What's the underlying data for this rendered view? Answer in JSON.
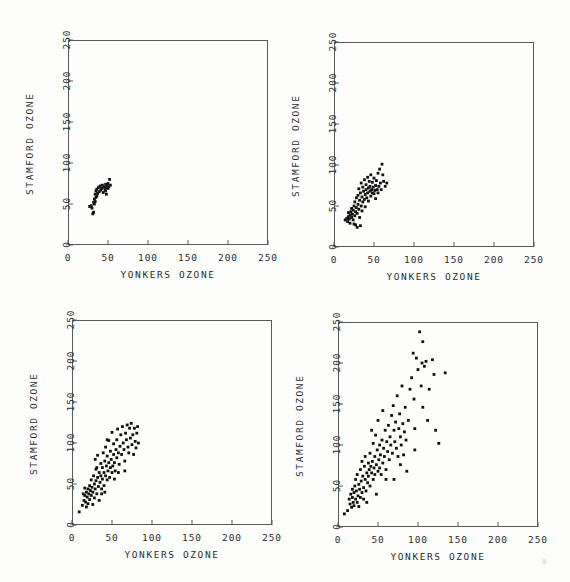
{
  "figure": {
    "background_color": "#fdfdfc",
    "ink_color": "#111111",
    "frame_color": "#5a5a5a",
    "width": 570,
    "height": 582
  },
  "chart_data": [
    {
      "id": "panel-top-left",
      "type": "scatter",
      "title": "",
      "xlabel": "YONKERS OZONE",
      "ylabel": "STAMFORD OZONE",
      "xlim": [
        0,
        250
      ],
      "ylim": [
        0,
        250
      ],
      "xticks": [
        0,
        50,
        100,
        150,
        200,
        250
      ],
      "yticks": [
        0,
        50,
        100,
        150,
        200,
        250
      ],
      "xticklabels": [
        "0",
        "50",
        "100",
        "150",
        "200",
        "250"
      ],
      "yticklabels": [
        "0",
        "50",
        "100",
        "150",
        "200",
        "250"
      ],
      "grid": false,
      "legend": "none",
      "marker": "filled-square",
      "points": [
        [
          27,
          47
        ],
        [
          29,
          48
        ],
        [
          30,
          45
        ],
        [
          31,
          38
        ],
        [
          32,
          40
        ],
        [
          32,
          52
        ],
        [
          33,
          50
        ],
        [
          33,
          56
        ],
        [
          34,
          62
        ],
        [
          34,
          53
        ],
        [
          35,
          58
        ],
        [
          35,
          66
        ],
        [
          36,
          60
        ],
        [
          36,
          68
        ],
        [
          37,
          63
        ],
        [
          38,
          70
        ],
        [
          39,
          65
        ],
        [
          40,
          72
        ],
        [
          41,
          67
        ],
        [
          42,
          69
        ],
        [
          43,
          73
        ],
        [
          44,
          64
        ],
        [
          45,
          71
        ],
        [
          46,
          68
        ],
        [
          47,
          74
        ],
        [
          47,
          66
        ],
        [
          48,
          70
        ],
        [
          48,
          62
        ],
        [
          49,
          72
        ],
        [
          50,
          69
        ],
        [
          50,
          75
        ],
        [
          51,
          71
        ],
        [
          52,
          80
        ],
        [
          53,
          73
        ]
      ]
    },
    {
      "id": "panel-top-right",
      "type": "scatter",
      "title": "",
      "xlabel": "YONKERS OZONE",
      "ylabel": "STAMFORD OZONE",
      "xlim": [
        0,
        250
      ],
      "ylim": [
        0,
        250
      ],
      "xticks": [
        0,
        50,
        100,
        150,
        200,
        250
      ],
      "yticks": [
        0,
        50,
        100,
        150,
        200,
        250
      ],
      "xticklabels": [
        "0",
        "50",
        "100",
        "150",
        "200",
        "250"
      ],
      "yticklabels": [
        "0",
        "50",
        "100",
        "150",
        "200",
        "250"
      ],
      "grid": false,
      "legend": "none",
      "marker": "filled-square",
      "points": [
        [
          14,
          33
        ],
        [
          16,
          35
        ],
        [
          17,
          31
        ],
        [
          18,
          37
        ],
        [
          18,
          42
        ],
        [
          19,
          34
        ],
        [
          20,
          39
        ],
        [
          20,
          29
        ],
        [
          21,
          43
        ],
        [
          22,
          36
        ],
        [
          22,
          47
        ],
        [
          23,
          40
        ],
        [
          24,
          33
        ],
        [
          24,
          45
        ],
        [
          25,
          50
        ],
        [
          26,
          38
        ],
        [
          26,
          55
        ],
        [
          27,
          43
        ],
        [
          27,
          27
        ],
        [
          28,
          48
        ],
        [
          28,
          60
        ],
        [
          29,
          41
        ],
        [
          30,
          52
        ],
        [
          30,
          63
        ],
        [
          31,
          46
        ],
        [
          31,
          71
        ],
        [
          32,
          57
        ],
        [
          32,
          36
        ],
        [
          33,
          66
        ],
        [
          34,
          50
        ],
        [
          34,
          78
        ],
        [
          35,
          61
        ],
        [
          35,
          44
        ],
        [
          36,
          73
        ],
        [
          36,
          55
        ],
        [
          37,
          68
        ],
        [
          38,
          82
        ],
        [
          38,
          58
        ],
        [
          39,
          64
        ],
        [
          39,
          49
        ],
        [
          40,
          76
        ],
        [
          40,
          70
        ],
        [
          41,
          60
        ],
        [
          42,
          85
        ],
        [
          42,
          66
        ],
        [
          43,
          72
        ],
        [
          43,
          56
        ],
        [
          44,
          80
        ],
        [
          45,
          68
        ],
        [
          45,
          74
        ],
        [
          46,
          62
        ],
        [
          46,
          88
        ],
        [
          47,
          70
        ],
        [
          48,
          66
        ],
        [
          48,
          79
        ],
        [
          49,
          73
        ],
        [
          50,
          65
        ],
        [
          50,
          84
        ],
        [
          51,
          69
        ],
        [
          52,
          75
        ],
        [
          52,
          59
        ],
        [
          53,
          81
        ],
        [
          54,
          70
        ],
        [
          55,
          90
        ],
        [
          55,
          66
        ],
        [
          56,
          74
        ],
        [
          57,
          95
        ],
        [
          58,
          78
        ],
        [
          59,
          70
        ],
        [
          60,
          101
        ],
        [
          61,
          88
        ],
        [
          62,
          80
        ],
        [
          64,
          74
        ],
        [
          66,
          78
        ],
        [
          29,
          24
        ],
        [
          33,
          26
        ],
        [
          25,
          28
        ]
      ]
    },
    {
      "id": "panel-bottom-left",
      "type": "scatter",
      "title": "",
      "xlabel": "YONKERS OZONE",
      "ylabel": "STAMFORD OZONE",
      "xlim": [
        0,
        250
      ],
      "ylim": [
        0,
        250
      ],
      "xticks": [
        0,
        50,
        100,
        150,
        200,
        250
      ],
      "yticks": [
        0,
        50,
        100,
        150,
        200,
        250
      ],
      "xticklabels": [
        "0",
        "50",
        "100",
        "150",
        "200",
        "250"
      ],
      "yticklabels": [
        "0",
        "50",
        "100",
        "150",
        "200",
        "250"
      ],
      "grid": false,
      "legend": "none",
      "marker": "filled-square",
      "points": [
        [
          9,
          16
        ],
        [
          13,
          24
        ],
        [
          14,
          38
        ],
        [
          15,
          30
        ],
        [
          16,
          36
        ],
        [
          16,
          45
        ],
        [
          17,
          28
        ],
        [
          18,
          40
        ],
        [
          18,
          22
        ],
        [
          19,
          34
        ],
        [
          20,
          44
        ],
        [
          20,
          26
        ],
        [
          21,
          38
        ],
        [
          22,
          48
        ],
        [
          22,
          31
        ],
        [
          23,
          42
        ],
        [
          24,
          36
        ],
        [
          24,
          55
        ],
        [
          25,
          46
        ],
        [
          26,
          40
        ],
        [
          26,
          25
        ],
        [
          27,
          60
        ],
        [
          28,
          50
        ],
        [
          28,
          33
        ],
        [
          29,
          44
        ],
        [
          30,
          68
        ],
        [
          30,
          54
        ],
        [
          31,
          38
        ],
        [
          32,
          85
        ],
        [
          32,
          58
        ],
        [
          33,
          47
        ],
        [
          34,
          64
        ],
        [
          34,
          30
        ],
        [
          35,
          52
        ],
        [
          36,
          75
        ],
        [
          36,
          60
        ],
        [
          37,
          44
        ],
        [
          38,
          70
        ],
        [
          38,
          56
        ],
        [
          39,
          88
        ],
        [
          40,
          64
        ],
        [
          40,
          48
        ],
        [
          41,
          78
        ],
        [
          42,
          60
        ],
        [
          42,
          95
        ],
        [
          43,
          72
        ],
        [
          44,
          55
        ],
        [
          44,
          84
        ],
        [
          45,
          66
        ],
        [
          46,
          103
        ],
        [
          46,
          76
        ],
        [
          47,
          58
        ],
        [
          48,
          70
        ],
        [
          48,
          90
        ],
        [
          49,
          80
        ],
        [
          50,
          64
        ],
        [
          50,
          113
        ],
        [
          51,
          72
        ],
        [
          52,
          86
        ],
        [
          52,
          99
        ],
        [
          53,
          76
        ],
        [
          54,
          66
        ],
        [
          55,
          92
        ],
        [
          56,
          104
        ],
        [
          56,
          82
        ],
        [
          57,
          117
        ],
        [
          58,
          88
        ],
        [
          59,
          74
        ],
        [
          60,
          96
        ],
        [
          61,
          110
        ],
        [
          62,
          86
        ],
        [
          63,
          120
        ],
        [
          64,
          100
        ],
        [
          65,
          92
        ],
        [
          66,
          78
        ],
        [
          67,
          112
        ],
        [
          68,
          104
        ],
        [
          69,
          122
        ],
        [
          70,
          95
        ],
        [
          71,
          88
        ],
        [
          72,
          118
        ],
        [
          73,
          106
        ],
        [
          74,
          124
        ],
        [
          75,
          98
        ],
        [
          76,
          110
        ],
        [
          77,
          86
        ],
        [
          78,
          118
        ],
        [
          79,
          102
        ],
        [
          80,
          94
        ],
        [
          81,
          112
        ],
        [
          82,
          120
        ],
        [
          83,
          100
        ],
        [
          29,
          80
        ],
        [
          31,
          70
        ],
        [
          37,
          38
        ],
        [
          41,
          40
        ],
        [
          44,
          104
        ],
        [
          53,
          56
        ],
        [
          58,
          64
        ],
        [
          66,
          66
        ]
      ]
    },
    {
      "id": "panel-bottom-right",
      "type": "scatter",
      "title": "",
      "xlabel": "YONKERS OZONE",
      "ylabel": "STAMFORD OZONE",
      "xlim": [
        0,
        250
      ],
      "ylim": [
        0,
        250
      ],
      "xticks": [
        0,
        50,
        100,
        150,
        200,
        250
      ],
      "yticks": [
        0,
        50,
        100,
        150,
        200,
        250
      ],
      "xticklabels": [
        "0",
        "50",
        "100",
        "150",
        "200",
        "250"
      ],
      "yticklabels": [
        "0",
        "50",
        "100",
        "150",
        "200",
        "250"
      ],
      "grid": false,
      "legend": "none",
      "marker": "filled-square",
      "points": [
        [
          8,
          16
        ],
        [
          12,
          20
        ],
        [
          14,
          34
        ],
        [
          15,
          28
        ],
        [
          16,
          40
        ],
        [
          17,
          24
        ],
        [
          18,
          36
        ],
        [
          18,
          46
        ],
        [
          19,
          30
        ],
        [
          20,
          42
        ],
        [
          20,
          26
        ],
        [
          21,
          50
        ],
        [
          22,
          34
        ],
        [
          22,
          58
        ],
        [
          23,
          44
        ],
        [
          24,
          30
        ],
        [
          24,
          64
        ],
        [
          25,
          38
        ],
        [
          26,
          52
        ],
        [
          26,
          25
        ],
        [
          27,
          46
        ],
        [
          28,
          70
        ],
        [
          28,
          36
        ],
        [
          29,
          56
        ],
        [
          30,
          42
        ],
        [
          30,
          80
        ],
        [
          31,
          62
        ],
        [
          32,
          48
        ],
        [
          32,
          34
        ],
        [
          33,
          74
        ],
        [
          34,
          58
        ],
        [
          34,
          86
        ],
        [
          35,
          44
        ],
        [
          36,
          66
        ],
        [
          36,
          30
        ],
        [
          37,
          54
        ],
        [
          38,
          78
        ],
        [
          38,
          62
        ],
        [
          39,
          70
        ],
        [
          40,
          50
        ],
        [
          40,
          90
        ],
        [
          41,
          74
        ],
        [
          42,
          66
        ],
        [
          42,
          118
        ],
        [
          43,
          80
        ],
        [
          44,
          58
        ],
        [
          44,
          102
        ],
        [
          45,
          72
        ],
        [
          46,
          86
        ],
        [
          46,
          64
        ],
        [
          47,
          112
        ],
        [
          48,
          76
        ],
        [
          48,
          40
        ],
        [
          49,
          94
        ],
        [
          50,
          68
        ],
        [
          50,
          130
        ],
        [
          51,
          82
        ],
        [
          52,
          100
        ],
        [
          52,
          72
        ],
        [
          53,
          88
        ],
        [
          54,
          64
        ],
        [
          55,
          106
        ],
        [
          56,
          78
        ],
        [
          56,
          142
        ],
        [
          57,
          96
        ],
        [
          58,
          86
        ],
        [
          59,
          118
        ],
        [
          60,
          70
        ],
        [
          60,
          58
        ],
        [
          61,
          104
        ],
        [
          62,
          92
        ],
        [
          63,
          124
        ],
        [
          64,
          82
        ],
        [
          65,
          110
        ],
        [
          66,
          100
        ],
        [
          67,
          136
        ],
        [
          68,
          90
        ],
        [
          69,
          148
        ],
        [
          70,
          118
        ],
        [
          71,
          104
        ],
        [
          72,
          128
        ],
        [
          73,
          96
        ],
        [
          74,
          160
        ],
        [
          75,
          86
        ],
        [
          76,
          120
        ],
        [
          77,
          138
        ],
        [
          78,
          110
        ],
        [
          79,
          100
        ],
        [
          80,
          172
        ],
        [
          81,
          126
        ],
        [
          82,
          88
        ],
        [
          83,
          116
        ],
        [
          84,
          146
        ],
        [
          85,
          106
        ],
        [
          88,
          130
        ],
        [
          90,
          168
        ],
        [
          92,
          182
        ],
        [
          94,
          212
        ],
        [
          95,
          156
        ],
        [
          96,
          120
        ],
        [
          98,
          206
        ],
        [
          100,
          192
        ],
        [
          102,
          238
        ],
        [
          104,
          172
        ],
        [
          105,
          200
        ],
        [
          106,
          226
        ],
        [
          108,
          196
        ],
        [
          110,
          202
        ],
        [
          112,
          130
        ],
        [
          114,
          168
        ],
        [
          118,
          204
        ],
        [
          120,
          186
        ],
        [
          122,
          118
        ],
        [
          126,
          102
        ],
        [
          134,
          188
        ],
        [
          106,
          146
        ],
        [
          96,
          94
        ],
        [
          86,
          68
        ],
        [
          78,
          76
        ],
        [
          70,
          58
        ]
      ]
    }
  ]
}
